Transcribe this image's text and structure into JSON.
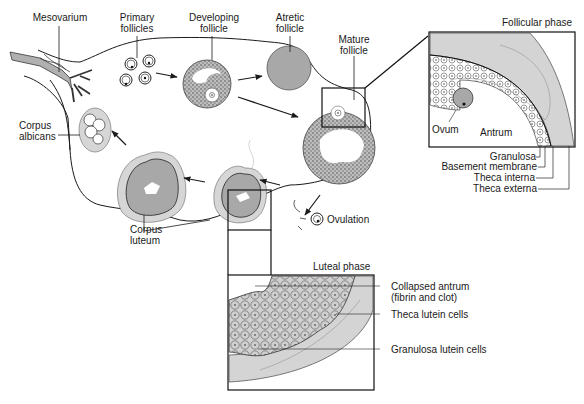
{
  "diagram": {
    "labels": {
      "mesovarium": "Mesovarium",
      "primary_follicles_1": "Primary",
      "primary_follicles_2": "follicles",
      "developing_follicle_1": "Developing",
      "developing_follicle_2": "follicle",
      "atretic_follicle_1": "Atretic",
      "atretic_follicle_2": "follicle",
      "mature_follicle_1": "Mature",
      "mature_follicle_2": "follicle",
      "corpus_albicans_1": "Corpus",
      "corpus_albicans_2": "albicans",
      "corpus_luteum_1": "Corpus",
      "corpus_luteum_2": "luteum",
      "ovulation": "Ovulation"
    },
    "follicular_phase_inset": {
      "title": "Follicular phase",
      "labels": {
        "ovum": "Ovum",
        "antrum": "Antrum",
        "granulosa": "Granulosa",
        "basement_membrane": "Basement membrane",
        "theca_interna": "Theca interna",
        "theca_externa": "Theca externa"
      }
    },
    "luteal_phase_inset": {
      "title": "Luteal phase",
      "labels": {
        "collapsed_antrum_1": "Collapsed antrum",
        "collapsed_antrum_2": "(fibrin and clot)",
        "theca_lutein_cells": "Theca lutein cells",
        "granulosa_lutein_cells": "Granulosa lutein cells"
      }
    },
    "colors": {
      "line": "#1a1a1a",
      "gray_fill": "#a8a8a8",
      "light_gray": "#d4d4d4",
      "background": "#ffffff"
    }
  }
}
